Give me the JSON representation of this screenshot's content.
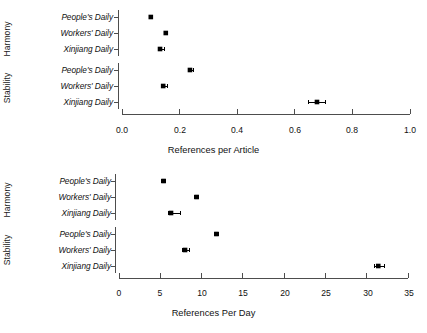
{
  "figure": {
    "background": "#ffffff",
    "point_color": "#000000",
    "line_color": "#4d4d4d"
  },
  "panels": [
    {
      "id": "top",
      "groups": [
        "Harmony",
        "Stability"
      ],
      "categories": [
        "People's Daily",
        "Workers' Daily",
        "Xinjiang Daily"
      ],
      "xlabel": "References per Article",
      "ticks": [
        "0.0",
        "0.2",
        "0.4",
        "0.6",
        "0.8",
        "1.0"
      ]
    },
    {
      "id": "bottom",
      "groups": [
        "Harmony",
        "Stability"
      ],
      "categories": [
        "People's Daily",
        "Workers' Daily",
        "Xinjiang Daily"
      ],
      "xlabel": "References Per Day",
      "ticks": [
        "0",
        "5",
        "10",
        "15",
        "20",
        "25",
        "30",
        "35"
      ]
    }
  ],
  "chart_data": [
    {
      "type": "scatter",
      "id": "references-per-article",
      "title": "",
      "xlabel": "References per Article",
      "ylabel": "",
      "xlim": [
        0.0,
        1.0
      ],
      "xticks": [
        0.0,
        0.2,
        0.4,
        0.6,
        0.8,
        1.0
      ],
      "xtick_labels": [
        "0.0",
        "0.2",
        "0.4",
        "0.6",
        "0.8",
        "1.0"
      ],
      "grid": false,
      "legend": "none",
      "orientation": "horizontal",
      "error_bars": true,
      "groups": [
        {
          "name": "Harmony",
          "points": [
            {
              "label": "People's Daily",
              "value": 0.1,
              "err_low": 0.1,
              "err_high": 0.1
            },
            {
              "label": "Workers' Daily",
              "value": 0.152,
              "err_low": 0.148,
              "err_high": 0.158
            },
            {
              "label": "Xinjiang Daily",
              "value": 0.132,
              "err_low": 0.128,
              "err_high": 0.148
            }
          ]
        },
        {
          "name": "Stability",
          "points": [
            {
              "label": "People's Daily",
              "value": 0.236,
              "err_low": 0.232,
              "err_high": 0.248
            },
            {
              "label": "Workers' Daily",
              "value": 0.143,
              "err_low": 0.139,
              "err_high": 0.158
            },
            {
              "label": "Xinjiang Daily",
              "value": 0.677,
              "err_low": 0.648,
              "err_high": 0.706
            }
          ]
        }
      ]
    },
    {
      "type": "scatter",
      "id": "references-per-day",
      "title": "",
      "xlabel": "References Per Day",
      "ylabel": "",
      "xlim": [
        0,
        35
      ],
      "xticks": [
        0,
        5,
        10,
        15,
        20,
        25,
        30,
        35
      ],
      "xtick_labels": [
        "0",
        "5",
        "10",
        "15",
        "20",
        "25",
        "30",
        "35"
      ],
      "grid": false,
      "legend": "none",
      "orientation": "horizontal",
      "error_bars": true,
      "groups": [
        {
          "name": "Harmony",
          "points": [
            {
              "label": "People's Daily",
              "value": 5.4,
              "err_low": 5.2,
              "err_high": 5.6
            },
            {
              "label": "Workers' Daily",
              "value": 9.4,
              "err_low": 9.2,
              "err_high": 9.6
            },
            {
              "label": "Xinjiang Daily",
              "value": 6.3,
              "err_low": 6.0,
              "err_high": 7.4
            }
          ]
        },
        {
          "name": "Stability",
          "points": [
            {
              "label": "People's Daily",
              "value": 11.8,
              "err_low": 11.6,
              "err_high": 12.0
            },
            {
              "label": "Workers' Daily",
              "value": 8.0,
              "err_low": 7.7,
              "err_high": 8.5
            },
            {
              "label": "Xinjiang Daily",
              "value": 31.4,
              "err_low": 30.9,
              "err_high": 32.2
            }
          ]
        }
      ]
    }
  ]
}
